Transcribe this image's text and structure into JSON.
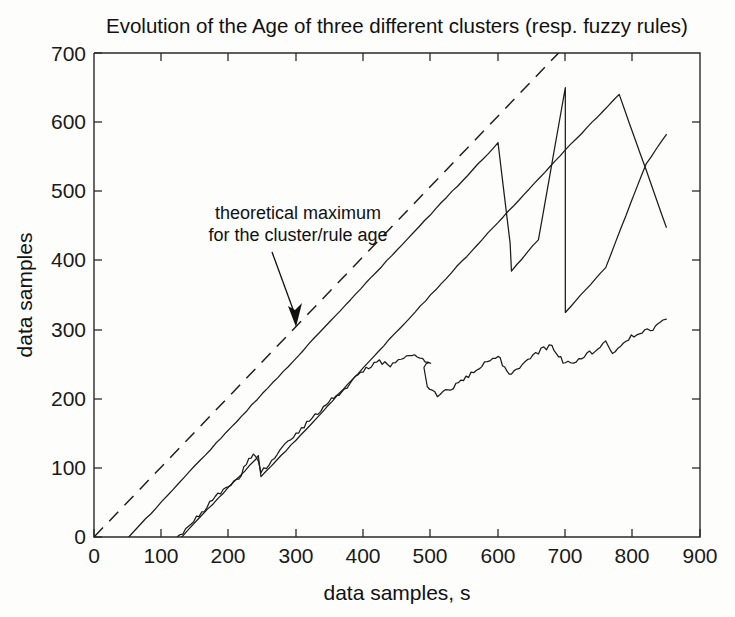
{
  "figure": {
    "background_color": "#fdfdfc",
    "line_color": "#1c1c1c",
    "title": "Evolution of the Age of three different clusters (resp. fuzzy rules)"
  },
  "annotation": {
    "line1": "theoretical maximum",
    "line2": "for the cluster/rule age"
  },
  "axes": {
    "x_label": "data samples, s",
    "y_label": "data samples",
    "x_ticks": [
      "0",
      "100",
      "200",
      "300",
      "400",
      "500",
      "600",
      "700",
      "800",
      "900"
    ],
    "y_ticks": [
      "0",
      "100",
      "200",
      "300",
      "400",
      "500",
      "600",
      "700"
    ]
  },
  "chart_data": {
    "type": "line",
    "title": "Evolution of the Age of three different clusters (resp. fuzzy rules)",
    "xlabel": "data samples, s",
    "ylabel": "data samples",
    "xlim": [
      0,
      900
    ],
    "ylim": [
      0,
      700
    ],
    "xticks": [
      0,
      100,
      200,
      300,
      400,
      500,
      600,
      700,
      800,
      900
    ],
    "yticks": [
      0,
      100,
      200,
      300,
      400,
      500,
      600,
      700
    ],
    "grid": false,
    "legend": "none",
    "annotations": [
      {
        "text": "theoretical maximum for the cluster/rule age",
        "text_xy": [
          300,
          470
        ],
        "arrow_target_xy": [
          318,
          305
        ]
      }
    ],
    "series": [
      {
        "name": "theoretical maximum",
        "style": "dashed",
        "points": [
          [
            0,
            0
          ],
          [
            690,
            700
          ]
        ]
      },
      {
        "name": "cluster/rule age 1",
        "style": "solid",
        "points": [
          [
            52,
            0
          ],
          [
            150,
            103
          ],
          [
            250,
            207
          ],
          [
            350,
            311
          ],
          [
            450,
            415
          ],
          [
            540,
            508
          ],
          [
            600,
            570
          ],
          [
            618,
            425
          ],
          [
            620,
            385
          ],
          [
            660,
            430
          ],
          [
            700,
            650
          ],
          [
            700,
            325
          ],
          [
            760,
            390
          ],
          [
            820,
            540
          ],
          [
            850,
            582
          ]
        ],
        "resets": [
          {
            "x": 618,
            "from": 570,
            "to": 385
          },
          {
            "x": 700,
            "from": 650,
            "to": 325
          }
        ]
      },
      {
        "name": "cluster/rule age 2",
        "style": "solid",
        "points": [
          [
            130,
            0
          ],
          [
            200,
            72
          ],
          [
            240,
            112
          ],
          [
            244,
            118
          ],
          [
            248,
            88
          ],
          [
            300,
            140
          ],
          [
            400,
            245
          ],
          [
            500,
            350
          ],
          [
            600,
            455
          ],
          [
            700,
            560
          ],
          [
            780,
            640
          ],
          [
            850,
            448
          ]
        ]
      },
      {
        "name": "cluster/rule age 3",
        "style": "solid-jagged",
        "points": [
          [
            124,
            0
          ],
          [
            160,
            35
          ],
          [
            180,
            60
          ],
          [
            200,
            72
          ],
          [
            215,
            85
          ],
          [
            230,
            112
          ],
          [
            240,
            120
          ],
          [
            248,
            95
          ],
          [
            260,
            105
          ],
          [
            280,
            128
          ],
          [
            300,
            150
          ],
          [
            320,
            168
          ],
          [
            345,
            192
          ],
          [
            360,
            205
          ],
          [
            380,
            222
          ],
          [
            400,
            240
          ],
          [
            420,
            255
          ],
          [
            440,
            248
          ],
          [
            460,
            258
          ],
          [
            480,
            262
          ],
          [
            500,
            252
          ],
          [
            490,
            248
          ],
          [
            495,
            215
          ],
          [
            510,
            205
          ],
          [
            530,
            215
          ],
          [
            560,
            235
          ],
          [
            580,
            250
          ],
          [
            600,
            262
          ],
          [
            610,
            245
          ],
          [
            620,
            235
          ],
          [
            640,
            252
          ],
          [
            660,
            268
          ],
          [
            680,
            278
          ],
          [
            690,
            262
          ],
          [
            700,
            250
          ],
          [
            720,
            258
          ],
          [
            740,
            268
          ],
          [
            760,
            280
          ],
          [
            770,
            268
          ],
          [
            790,
            285
          ],
          [
            810,
            295
          ],
          [
            830,
            300
          ],
          [
            845,
            312
          ],
          [
            850,
            315
          ]
        ]
      }
    ]
  }
}
